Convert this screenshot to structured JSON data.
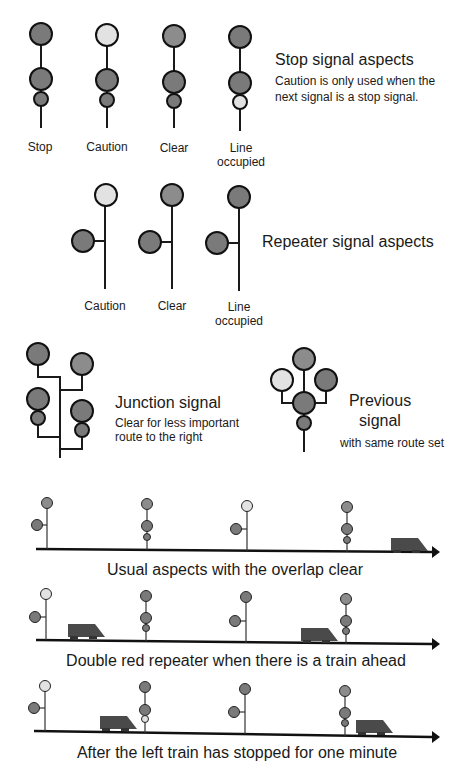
{
  "stop_signals": {
    "title": "Stop signal aspects",
    "note_line1": "Caution is only used when the",
    "note_line2": "next signal is a stop signal.",
    "labels": [
      "Stop",
      "Caution",
      "Clear",
      "Line",
      "occupied"
    ]
  },
  "repeater_signals": {
    "title": "Repeater signal aspects",
    "labels": [
      "Caution",
      "Clear",
      "Line",
      "occupied"
    ]
  },
  "junction_signal": {
    "title": "Junction signal",
    "note_line1": "Clear for less important",
    "note_line2": "route to the right"
  },
  "previous_signal": {
    "title_line1": "Previous",
    "title_line2": "signal",
    "note": "with same route set"
  },
  "scenarios": [
    {
      "caption": "Usual aspects with the overlap clear"
    },
    {
      "caption": "Double red repeater when there is a train ahead"
    },
    {
      "caption": "After the left train has stopped for one minute"
    }
  ],
  "colors": {
    "red_lamp": "#7a7a7a",
    "green_lamp": "#8c8c8c",
    "yellow_lamp": "#e2e2e2",
    "train": "#4a4a4a",
    "line": "#1a1a1a"
  }
}
